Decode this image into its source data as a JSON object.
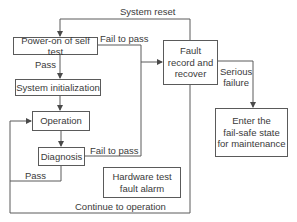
{
  "diagram": {
    "nodes": {
      "power_on": "Power-on of self test",
      "system_init": "System initialization",
      "operation": "Operation",
      "diagnosis": "Diagnosis",
      "hardware_alarm": "Hardware test\nfault alarm",
      "fault_record": "Fault\nrecord and\nrecover",
      "fail_safe": "Enter  the\nfail-safe state\nfor maintenance"
    },
    "edges": {
      "system_reset": "System reset",
      "power_fail": "Fail to pass",
      "power_pass": "Pass",
      "diag_fail": "Fail to pass",
      "diag_pass": "Pass",
      "serious_failure": "Serious\nfailure",
      "continue": "Continue to operation"
    },
    "colors": {
      "line": "#5a5a5a",
      "text": "#3a3a3a"
    }
  }
}
